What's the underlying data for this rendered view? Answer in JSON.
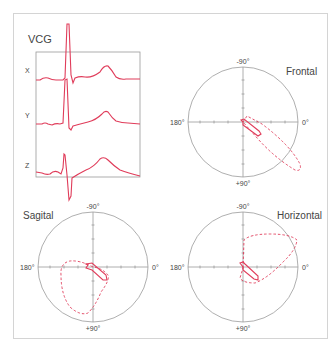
{
  "figure": {
    "title": "VCG",
    "colors": {
      "trace": "#e03c5a",
      "axis": "#9a9a9a",
      "frame": "#d4d4d4",
      "text": "#444444"
    }
  },
  "vcg_panel": {
    "leads": [
      {
        "label": "X"
      },
      {
        "label": "Y"
      },
      {
        "label": "Z"
      }
    ]
  },
  "loops": [
    {
      "name": "Frontal",
      "top": "-90°",
      "bottom": "+90°",
      "left": "180°",
      "right": "0°"
    },
    {
      "name": "Sagital",
      "top": "-90°",
      "bottom": "+90°",
      "left": "180°",
      "right": "0°"
    },
    {
      "name": "Horizontal",
      "top": "-90°",
      "bottom": "+90°",
      "left": "180°",
      "right": "0°"
    }
  ],
  "legend": {
    "solid": "QRS / vector loop (solid)",
    "dashed": "T loop (dashed)"
  }
}
